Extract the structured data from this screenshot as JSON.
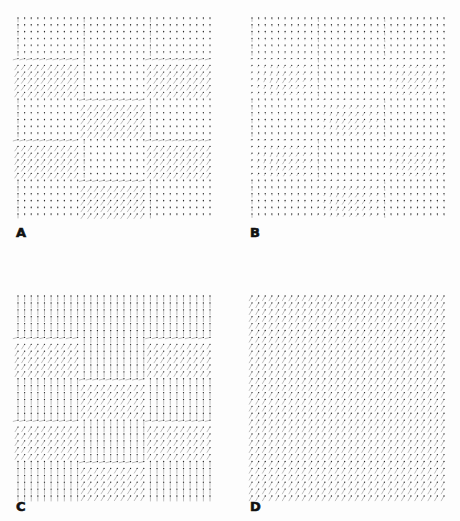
{
  "figure": {
    "background": "#fdfdfd",
    "segment_color": "#8a8a8a",
    "head_color": "#2a2a2a",
    "panels": [
      {
        "id": "A",
        "label": "A",
        "label_pos": [
          16,
          226
        ],
        "box": [
          16,
          16,
          192,
          196
        ],
        "grid": [
          30,
          30
        ],
        "description": "Checkerboard block field: horizontal-ish dot base with slanted rectangular blocks in a 3x5 arrangement",
        "base": {
          "angle": 90,
          "length": 1.2
        },
        "block_cols": 3,
        "block_rows": 5,
        "blocks": [
          [
            0,
            0,
            0
          ],
          [
            1,
            0,
            1
          ],
          [
            0,
            1,
            0
          ],
          [
            1,
            0,
            1
          ],
          [
            0,
            1,
            0
          ]
        ],
        "block_field": {
          "angle": 55,
          "length": 5.5
        },
        "border_field": {
          "angle": 90,
          "length": 4
        }
      },
      {
        "id": "B",
        "label": "B",
        "label_pos": [
          250,
          226
        ],
        "box": [
          250,
          16,
          192,
          196
        ],
        "grid": [
          30,
          30
        ],
        "description": "Smoothed field: mostly short vectors with gentle slanted zones and vertical bands",
        "base": {
          "angle": 90,
          "length": 1.5
        },
        "block_cols": 3,
        "block_rows": 5,
        "blocks": [
          [
            0,
            0,
            0
          ],
          [
            1,
            0,
            1
          ],
          [
            0,
            1,
            0
          ],
          [
            1,
            0,
            1
          ],
          [
            0,
            1,
            0
          ]
        ],
        "block_field": {
          "angle": 60,
          "length": 3.5
        },
        "border_field": {
          "angle": 90,
          "length": 3.5
        },
        "smooth": true
      },
      {
        "id": "C",
        "label": "C",
        "label_pos": [
          16,
          500
        ],
        "box": [
          16,
          294,
          192,
          200
        ],
        "grid": [
          30,
          30
        ],
        "description": "Vertical base field with slanted blocks in 3x5 arrangement",
        "base": {
          "angle": 90,
          "length": 5
        },
        "block_cols": 3,
        "block_rows": 5,
        "blocks": [
          [
            0,
            0,
            0
          ],
          [
            1,
            0,
            1
          ],
          [
            0,
            1,
            0
          ],
          [
            1,
            0,
            1
          ],
          [
            0,
            1,
            0
          ]
        ],
        "block_field": {
          "angle": 58,
          "length": 5.5
        },
        "border_field": {
          "angle": 90,
          "length": 5
        }
      },
      {
        "id": "D",
        "label": "D",
        "label_pos": [
          250,
          500
        ],
        "box": [
          250,
          294,
          192,
          200
        ],
        "grid": [
          30,
          30
        ],
        "description": "Uniform slanted field",
        "base": {
          "angle": 60,
          "length": 5.5
        },
        "block_cols": 1,
        "block_rows": 1,
        "blocks": [
          [
            0
          ]
        ],
        "block_field": {
          "angle": 60,
          "length": 5.5
        },
        "border_field": {
          "angle": 60,
          "length": 5.5
        }
      }
    ]
  }
}
